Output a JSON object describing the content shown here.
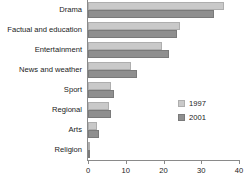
{
  "chart_data": {
    "type": "bar",
    "orientation": "horizontal",
    "title": "",
    "subtitle": "",
    "xlabel": "",
    "ylabel": "",
    "xlim": [
      0,
      40
    ],
    "xticks": [
      0,
      10,
      20,
      30,
      40
    ],
    "xtick_labels": [
      "0",
      "10",
      "20",
      "30",
      "40"
    ],
    "grid": false,
    "legend_position": "middle-right",
    "categories": [
      "Drama",
      "Factual and education",
      "Entertainment",
      "News and weather",
      "Sport",
      "Regional",
      "Arts",
      "Religion"
    ],
    "series": [
      {
        "name": "1997",
        "color": "#c9c9c9",
        "values": [
          36,
          24.5,
          19.5,
          11.5,
          6,
          5.5,
          2.5,
          0.6
        ]
      },
      {
        "name": "2001",
        "color": "#8f8f8f",
        "values": [
          33.5,
          23.5,
          21.5,
          13,
          7,
          6,
          3,
          0.5
        ]
      }
    ]
  },
  "legend": {
    "entries": [
      {
        "label": "1997"
      },
      {
        "label": "2001"
      }
    ]
  }
}
